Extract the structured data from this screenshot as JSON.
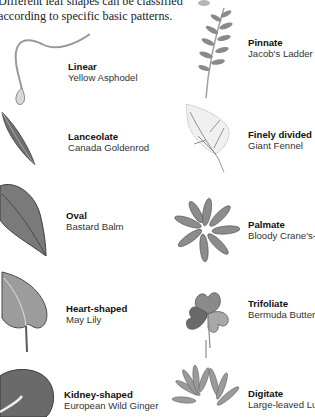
{
  "intro": {
    "line1": "Different leaf shapes can be classified",
    "line2": "according to specific basic patterns."
  },
  "leaves": [
    {
      "name": "Linear",
      "species": "Yellow Asphodel",
      "icon": "linear-leaf-icon"
    },
    {
      "name": "Lanceolate",
      "species": "Canada Goldenrod",
      "icon": "lanceolate-leaf-icon"
    },
    {
      "name": "Oval",
      "species": "Bastard Balm",
      "icon": "oval-leaf-icon"
    },
    {
      "name": "Heart-shaped",
      "species": "May Lily",
      "icon": "heart-shaped-leaf-icon"
    },
    {
      "name": "Kidney-shaped",
      "species": "European Wild Ginger",
      "icon": "kidney-shaped-leaf-icon"
    },
    {
      "name": "Pinnate",
      "species": "Jacob's Ladder",
      "icon": "pinnate-leaf-icon"
    },
    {
      "name": "Finely divided",
      "species": "Giant Fennel",
      "icon": "finely-divided-leaf-icon"
    },
    {
      "name": "Palmate",
      "species": "Bloody Crane's-bill",
      "icon": "palmate-leaf-icon"
    },
    {
      "name": "Trifoliate",
      "species": "Bermuda Buttercup",
      "icon": "trifoliate-leaf-icon"
    },
    {
      "name": "Digitate",
      "species": "Large-leaved Lupin",
      "icon": "digitate-leaf-icon"
    }
  ]
}
